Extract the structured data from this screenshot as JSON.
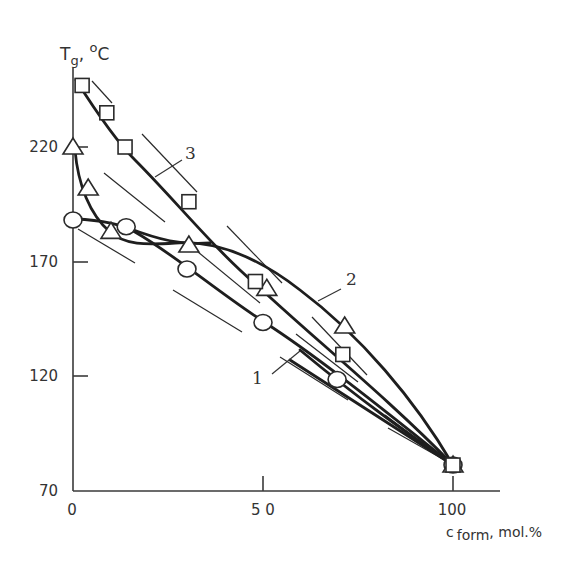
{
  "chart_data": {
    "type": "scatter",
    "title": "",
    "xlabel": "c form, mol.%",
    "ylabel": "Tg, °C",
    "xlim": [
      0,
      110
    ],
    "ylim": [
      70,
      250
    ],
    "x_ticks": [
      0,
      50,
      100
    ],
    "y_ticks": [
      70,
      120,
      170,
      220
    ],
    "grid": false,
    "legend": "curve numbers labelled inline (1, 2, 3)",
    "series": [
      {
        "name": "1",
        "marker": "circle",
        "x": [
          0,
          14,
          30,
          50,
          69.5,
          100
        ],
        "values": [
          188,
          185,
          166.5,
          143,
          118,
          80.5
        ]
      },
      {
        "name": "2",
        "marker": "triangle",
        "x": [
          0,
          4,
          10,
          30.5,
          51,
          71.5,
          100
        ],
        "values": [
          220,
          202,
          183,
          177,
          158,
          141.5,
          80.5
        ]
      },
      {
        "name": "3",
        "marker": "square",
        "x": [
          2.4,
          8.9,
          13.7,
          30.5,
          48,
          71,
          100
        ],
        "values": [
          247,
          235,
          220,
          196,
          161,
          129,
          80.5
        ]
      }
    ]
  },
  "axes": {
    "y_title_main": "T",
    "y_title_sub": "g",
    "y_title_unit": ", ",
    "y_title_deg": "o",
    "y_title_c": "C",
    "x_title_c": "c",
    "x_title_sub": "form",
    "x_title_unit": ", mol.%",
    "x_tick_labels": [
      "0",
      "5 0",
      "100"
    ],
    "y_tick_labels": [
      "70",
      "120",
      "170",
      "220"
    ]
  },
  "labels": {
    "curve1": "1",
    "curve2": "2",
    "curve3": "3"
  }
}
